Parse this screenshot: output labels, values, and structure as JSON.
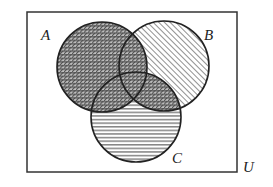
{
  "diagram": {
    "type": "venn",
    "universe_label": "U",
    "sets": [
      {
        "label": "A",
        "fill_pattern": "crosshatch"
      },
      {
        "label": "B",
        "fill_pattern": "diagonal-lines"
      },
      {
        "label": "C",
        "fill_pattern": "horizontal-lines"
      }
    ],
    "shaded_regions": [
      "A",
      "B",
      "C"
    ],
    "intersections_pattern": "crosshatch",
    "colors": {
      "stroke": "#222222",
      "background": "#ffffff",
      "hatch": "#444444"
    }
  }
}
